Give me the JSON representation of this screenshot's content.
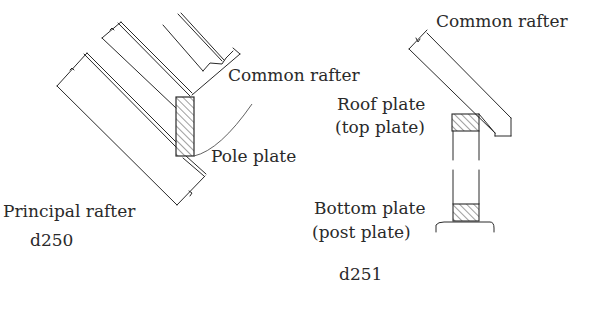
{
  "figures": [
    {
      "id": "d250",
      "caption": "d250",
      "labels": {
        "common_rafter": "Common rafter",
        "pole_plate": "Pole plate",
        "principal_rafter": "Principal rafter"
      }
    },
    {
      "id": "d251",
      "caption": "d251",
      "labels": {
        "common_rafter": "Common rafter",
        "roof_plate": "Roof plate",
        "roof_plate_alt": "(top plate)",
        "bottom_plate": "Bottom plate",
        "bottom_plate_alt": "(post plate)"
      }
    }
  ],
  "colors": {
    "ink": "#2a2a2a",
    "background": "#ffffff"
  }
}
